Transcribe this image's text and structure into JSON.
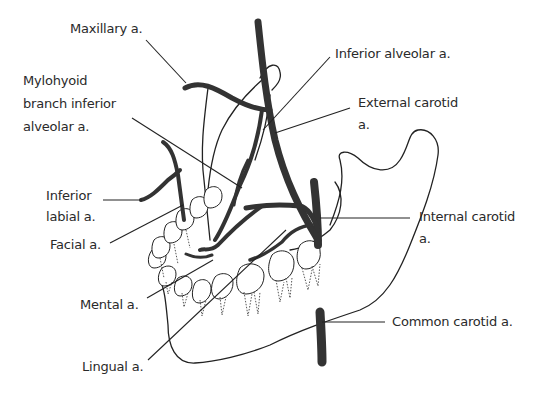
{
  "diagram": {
    "colors": {
      "artery": "#333333",
      "outline": "#222222",
      "leader_line": "#222222",
      "label_text": "#2a2a2a",
      "background": "#ffffff"
    },
    "labels": {
      "maxillary": "Maxillary a.",
      "mylohyoid_line1": "Mylohyoid",
      "mylohyoid_line2": "branch inferior",
      "mylohyoid_line3": "alveolar a.",
      "inferior_labial_line1": "Inferior",
      "inferior_labial_line2": "labial a.",
      "facial": "Facial a.",
      "mental": "Mental a.",
      "lingual": "Lingual a.",
      "inferior_alveolar": "Inferior alveolar a.",
      "external_carotid_line1": "External carotid",
      "external_carotid_line2": "a.",
      "internal_carotid_line1": "Internal carotid",
      "internal_carotid_line2": "a.",
      "common_carotid": "Common carotid a."
    }
  }
}
